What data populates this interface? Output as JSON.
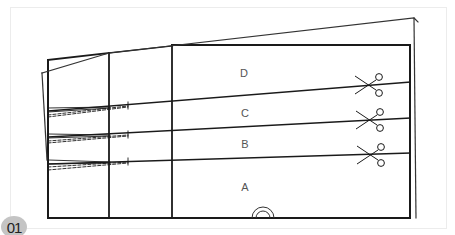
{
  "figure": {
    "badge": "01",
    "type": "sewing pattern layout",
    "panels": [
      {
        "id": "D",
        "label": "D"
      },
      {
        "id": "C",
        "label": "C"
      },
      {
        "id": "B",
        "label": "B"
      },
      {
        "id": "A",
        "label": "A"
      }
    ],
    "markers": {
      "cut_markers": [
        "scissors-icon",
        "scissors-icon",
        "scissors-icon"
      ],
      "fold_marker": "fold-symbol-icon"
    },
    "colors": {
      "line": "#1a1a1a",
      "frame": "#ececec",
      "badge_bg": "#c4c4c4",
      "label_text": "#555555"
    }
  }
}
